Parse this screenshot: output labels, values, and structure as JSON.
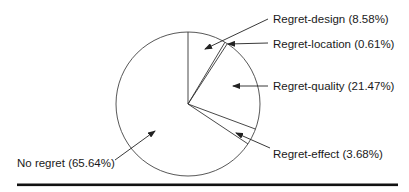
{
  "chart_data": {
    "type": "pie",
    "title": "",
    "start_angle": "12 o'clock",
    "direction": "clockwise",
    "slices": [
      {
        "label": "Regret-design",
        "value": 8.58,
        "display": "Regret-design (8.58%)"
      },
      {
        "label": "Regret-location",
        "value": 0.61,
        "display": "Regret-location (0.61%)"
      },
      {
        "label": "Regret-quality",
        "value": 21.47,
        "display": "Regret-quality (21.47%)"
      },
      {
        "label": "Regret-effect",
        "value": 3.68,
        "display": "Regret-effect (3.68%)"
      },
      {
        "label": "No regret",
        "value": 65.64,
        "display": "No regret (65.64%)"
      }
    ],
    "fill": "#ffffff",
    "stroke": "#333333"
  },
  "labels": {
    "design": "Regret-design (8.58%)",
    "location": "Regret-location (0.61%)",
    "quality": "Regret-quality (21.47%)",
    "effect": "Regret-effect (3.68%)",
    "noregret": "No regret (65.64%)"
  }
}
